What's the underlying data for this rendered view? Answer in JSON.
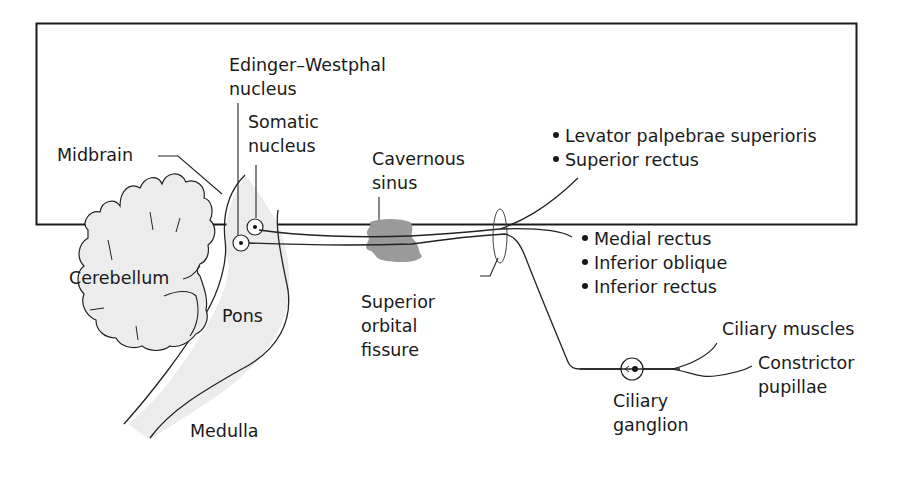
{
  "figure": {
    "colors": {
      "border": "#1a1a1a",
      "brainstem_fill": "#ececec",
      "cerebellum_fill": "#ececec",
      "sinus_fill": "#9a9a9a",
      "line": "#222222"
    }
  },
  "labels": {
    "edinger_westphal": "Edinger–Westphal\nnucleus",
    "somatic_nucleus": "Somatic\nnucleus",
    "midbrain": "Midbrain",
    "cerebellum": "Cerebellum",
    "pons": "Pons",
    "medulla": "Medulla",
    "cavernous_sinus": "Cavernous\nsinus",
    "superior_orbital_fissure": "Superior\norbital\nfissure",
    "ciliary_ganglion": "Ciliary\nganglion",
    "ciliary_muscles": "Ciliary muscles",
    "constrictor_pupillae": "Constrictor\npupillae"
  },
  "superior_division_targets": [
    "Levator palpebrae superioris",
    "Superior rectus"
  ],
  "inferior_division_targets": [
    "Medial rectus",
    "Inferior oblique",
    "Inferior rectus"
  ]
}
